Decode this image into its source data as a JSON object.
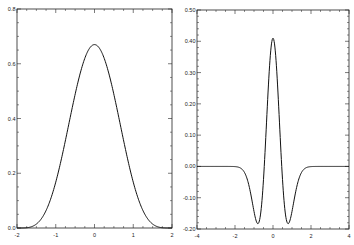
{
  "chart_data": [
    {
      "type": "line",
      "title": "",
      "xlabel": "",
      "ylabel": "",
      "xlim": [
        -2,
        2
      ],
      "ylim": [
        0,
        0.8
      ],
      "xticks": [
        -2,
        -1,
        0,
        1,
        2
      ],
      "xtick_labels": [
        "-2",
        "-1",
        "0",
        "1",
        "2"
      ],
      "yticks": [
        0,
        0.2,
        0.4,
        0.6,
        0.8
      ],
      "ytick_labels": [
        "0.0",
        "0.2",
        "0.4",
        "0.6",
        "0.8"
      ],
      "grid": false,
      "legend": null,
      "series": [
        {
          "name": "gaussian-like bump",
          "description": "Smooth bell-shaped curve peaking at about 0.67 at x=0, reaching 0 at x=-2 and x=2",
          "x": [
            -2,
            -1.75,
            -1.5,
            -1.25,
            -1,
            -0.75,
            -0.5,
            -0.25,
            0,
            0.25,
            0.5,
            0.75,
            1,
            1.25,
            1.5,
            1.75,
            2
          ],
          "y": [
            0.0,
            0.01,
            0.04,
            0.11,
            0.2,
            0.32,
            0.46,
            0.6,
            0.67,
            0.6,
            0.46,
            0.32,
            0.2,
            0.11,
            0.04,
            0.01,
            0.0
          ]
        }
      ]
    },
    {
      "type": "line",
      "title": "",
      "xlabel": "",
      "ylabel": "",
      "xlim": [
        -4,
        4
      ],
      "ylim": [
        -0.2,
        0.5
      ],
      "xticks": [
        -4,
        -2,
        0,
        2,
        4
      ],
      "xtick_labels": [
        "-4",
        "-2",
        "0",
        "2",
        "4"
      ],
      "yticks": [
        -0.2,
        -0.1,
        0.0,
        0.1,
        0.2,
        0.3,
        0.4,
        0.5
      ],
      "ytick_labels": [
        "-0.20",
        "-0.10",
        "0.00",
        "0.10",
        "0.20",
        "0.30",
        "0.40",
        "0.50"
      ],
      "grid": false,
      "legend": null,
      "series": [
        {
          "name": "mexican-hat wavelet",
          "description": "Central peak ~0.41 at x=0 with two negative lobes of ~-0.145 near x=±0.8, flat 0 beyond |x|>2.5",
          "x": [
            -4,
            -3,
            -2.5,
            -2,
            -1.5,
            -1.2,
            -1,
            -0.8,
            -0.6,
            -0.4,
            -0.2,
            0,
            0.2,
            0.4,
            0.6,
            0.8,
            1,
            1.2,
            1.5,
            2,
            2.5,
            3,
            4
          ],
          "y": [
            0.0,
            0.0,
            -0.002,
            -0.02,
            -0.07,
            -0.12,
            -0.14,
            -0.145,
            -0.1,
            0.06,
            0.28,
            0.41,
            0.28,
            0.06,
            -0.1,
            -0.145,
            -0.14,
            -0.12,
            -0.07,
            -0.02,
            -0.002,
            0.0,
            0.0
          ]
        }
      ]
    }
  ],
  "charts": [
    {
      "xtick_labels": [
        "-2",
        "-1",
        "0",
        "1",
        "2"
      ],
      "ytick_labels": [
        "0.0",
        "0.2",
        "0.4",
        "0.6",
        "0.8"
      ]
    },
    {
      "xtick_labels": [
        "-4",
        "-2",
        "0",
        "2",
        "4"
      ],
      "ytick_labels": [
        "-0.20",
        "-0.10",
        "0.00",
        "0.10",
        "0.20",
        "0.30",
        "0.40",
        "0.50"
      ]
    }
  ]
}
